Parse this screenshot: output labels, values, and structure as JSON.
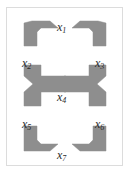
{
  "figure": {
    "background_color": "#ffffff",
    "border_color": "#dcdcdc",
    "piece_fill_color": "#8e8e8e",
    "piece_stroke_color": "#8e8e8e",
    "label_color": "#2b2b2b",
    "width": 130,
    "height": 174
  },
  "labels": [
    {
      "id": "x1",
      "base": "x",
      "sub": "1",
      "x": 57,
      "y": 21
    },
    {
      "id": "x2",
      "base": "x",
      "sub": "2",
      "x": 22,
      "y": 57
    },
    {
      "id": "x3",
      "base": "x",
      "sub": "3",
      "x": 95,
      "y": 57
    },
    {
      "id": "x4",
      "base": "x",
      "sub": "4",
      "x": 57,
      "y": 91
    },
    {
      "id": "x5",
      "base": "x",
      "sub": "5",
      "x": 22,
      "y": 118
    },
    {
      "id": "x6",
      "base": "x",
      "sub": "6",
      "x": 95,
      "y": 118
    },
    {
      "id": "x7",
      "base": "x",
      "sub": "7",
      "x": 57,
      "y": 149
    }
  ],
  "pieces": [
    {
      "id": "piece-top-left",
      "name": "top-left-bracket",
      "points": "24,22 33,22 33,22 47,22 56,30 37,30 37,44 24,44"
    },
    {
      "id": "piece-top-right",
      "name": "top-right-bracket",
      "points": "74,22 97,22 106,22 106,44 93,44 93,30 83,30"
    },
    {
      "id": "piece-mid-left",
      "name": "mid-left-bowtie-with-arm",
      "points": "24,66 41,66 41,78 56,78 66,78 66,92 56,92 41,92 41,104 24,104 32,85"
    },
    {
      "id": "piece-mid-right",
      "name": "mid-right-bowtie-with-arm",
      "points": "106,66 89,66 89,78 74,78 64,78 64,92 74,92 89,92 89,104 106,104 98,85"
    },
    {
      "id": "piece-bottom-left",
      "name": "bottom-left-bracket",
      "points": "24,127 37,127 37,141 56,141 47,149 33,149 24,149 24,141"
    },
    {
      "id": "piece-bottom-right",
      "name": "bottom-right-bracket",
      "points": "106,127 93,127 93,141 74,141 83,149 97,149 106,149 106,141"
    },
    {
      "id": "piece-center-filler",
      "name": "center-filler",
      "points": ""
    }
  ],
  "piece_labels_order": [
    "x1",
    "x2",
    "x3",
    "x4",
    "x5",
    "x6",
    "x7"
  ]
}
